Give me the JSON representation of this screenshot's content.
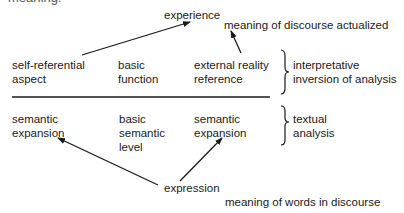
{
  "diagram": {
    "top_clipped_text": "meaning:",
    "top": {
      "experience": "experience",
      "discourse_note": "meaning of discourse actualized"
    },
    "upper_row": {
      "col1": "self-referential\naspect",
      "col2": "basic\nfunction",
      "col3": "external reality\nreference",
      "bracket_label": "interpretative\ninversion of analysis"
    },
    "lower_row": {
      "col1": "semantic\nexpansion",
      "col2": "basic\nsemantic\nlevel",
      "col3": "semantic\nexpansion",
      "bracket_label": "textual\nanalysis"
    },
    "bottom": {
      "expression": "expression",
      "words_note": "meaning of words in discourse"
    },
    "arrows": [
      {
        "from": "self-referential aspect",
        "to": "experience"
      },
      {
        "from": "external reality reference",
        "to": "meaning of discourse actualized"
      },
      {
        "from": "expression",
        "to": "semantic expansion (left)"
      },
      {
        "from": "expression",
        "to": "semantic expansion (right)"
      }
    ]
  }
}
